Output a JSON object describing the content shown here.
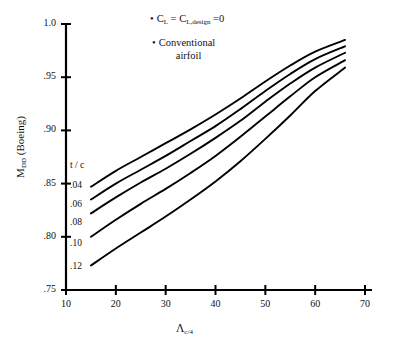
{
  "chart_data": {
    "type": "line",
    "title": "",
    "xlabel": "Λc/4",
    "ylabel": "MDD (Boeing)",
    "xlim": [
      10,
      70
    ],
    "ylim": [
      0.75,
      1.0
    ],
    "grid": false,
    "legend_position": "inline-left",
    "x_ticks": [
      "10",
      "20",
      "30",
      "40",
      "50",
      "60",
      "70"
    ],
    "y_ticks": [
      "1.0",
      ".95",
      ".90",
      ".85",
      ".80",
      ".75"
    ],
    "x_tick_values": [
      10,
      20,
      30,
      40,
      50,
      60,
      70
    ],
    "y_tick_values": [
      1.0,
      0.95,
      0.9,
      0.85,
      0.8,
      0.75
    ],
    "series_group_label": "t / c",
    "x": [
      15,
      20,
      25,
      30,
      35,
      40,
      45,
      50,
      55,
      60,
      66
    ],
    "series": [
      {
        "name": ".04",
        "values": [
          0.847,
          0.862,
          0.875,
          0.888,
          0.901,
          0.915,
          0.93,
          0.946,
          0.961,
          0.974,
          0.985
        ]
      },
      {
        "name": ".06",
        "values": [
          0.835,
          0.85,
          0.863,
          0.876,
          0.89,
          0.904,
          0.92,
          0.937,
          0.953,
          0.967,
          0.979
        ]
      },
      {
        "name": ".08",
        "values": [
          0.822,
          0.837,
          0.851,
          0.864,
          0.878,
          0.893,
          0.909,
          0.927,
          0.944,
          0.959,
          0.973
        ]
      },
      {
        "name": ".10",
        "values": [
          0.8,
          0.816,
          0.831,
          0.845,
          0.86,
          0.876,
          0.894,
          0.913,
          0.932,
          0.95,
          0.966
        ]
      },
      {
        "name": ".12",
        "values": [
          0.773,
          0.789,
          0.804,
          0.819,
          0.835,
          0.852,
          0.871,
          0.892,
          0.914,
          0.937,
          0.959
        ]
      }
    ],
    "annotations": [
      {
        "id": "note-cl",
        "bullet": "•",
        "text_parts": [
          "C",
          "L",
          " = C",
          "L,design",
          " =0"
        ],
        "plain": "• CL = CL,design =0"
      },
      {
        "id": "note-airfoil",
        "bullet": "•",
        "line1": "Conventional",
        "line2": "airfoil",
        "plain": "• Conventional airfoil"
      }
    ],
    "colors": {
      "curve": "#000000",
      "axis": "#000000",
      "background": "#ffffff",
      "text": "#111111"
    }
  }
}
